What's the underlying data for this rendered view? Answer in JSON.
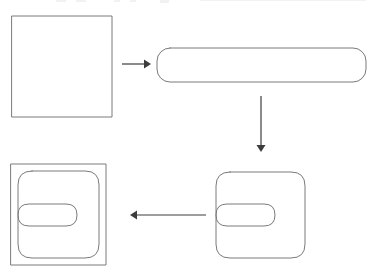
{
  "diagram": {
    "type": "process-cycle",
    "background_color": "#ffffff",
    "outline_color": "#7a7a7a",
    "arrow_color": "#3c3c3c",
    "canvas": {
      "width": 370,
      "height": 280
    },
    "steps": [
      {
        "id": "step-1",
        "name": "square",
        "label": "",
        "description": "plain square outline",
        "x": 12,
        "y": 16,
        "width": 100,
        "height": 101,
        "corner_radius": 0
      },
      {
        "id": "step-2",
        "name": "rounded-bar",
        "label": "",
        "description": "wide stadium / rounded rectangle bar",
        "x": 157,
        "y": 48,
        "width": 209,
        "height": 34,
        "corner_radius": 13
      },
      {
        "id": "step-3",
        "name": "notched-shape",
        "label": "",
        "description": "rounded square with a notch cut into the left side forming a C-like tongue",
        "x": 216,
        "y": 172,
        "width": 89,
        "height": 86,
        "corner_radius": 14,
        "notch_depth": 59,
        "notch_height": 23
      },
      {
        "id": "step-4",
        "name": "notched-shape-in-square",
        "label": "",
        "description": "the notched shape inscribed inside a square frame",
        "x": 11,
        "y": 164,
        "width": 95,
        "height": 101,
        "inner_inset": 7,
        "corner_radius": 14,
        "notch_depth": 59,
        "notch_height": 23
      }
    ],
    "arrows": [
      {
        "id": "arrow-1",
        "name": "arrow-square-to-bar",
        "direction": "right",
        "label": "",
        "from": "step-1",
        "to": "step-2",
        "x1": 122,
        "y1": 64,
        "x2": 149,
        "y2": 64
      },
      {
        "id": "arrow-2",
        "name": "arrow-bar-to-notched",
        "direction": "down",
        "label": "",
        "from": "step-2",
        "to": "step-3",
        "x1": 261,
        "y1": 96,
        "x2": 261,
        "y2": 151
      },
      {
        "id": "arrow-3",
        "name": "arrow-notched-to-framed",
        "direction": "left",
        "label": "",
        "from": "step-3",
        "to": "step-4",
        "x1": 206,
        "y1": 215,
        "x2": 131,
        "y2": 215
      }
    ]
  }
}
